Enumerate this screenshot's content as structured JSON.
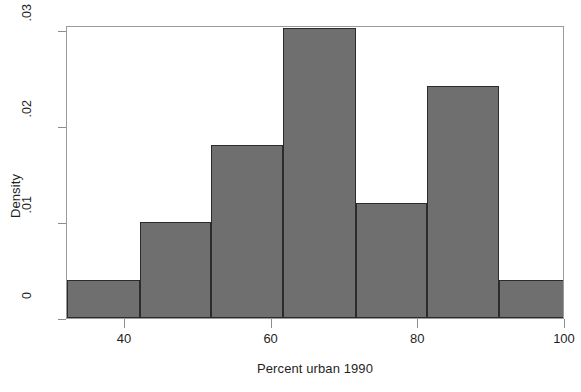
{
  "chart_data": {
    "type": "bar",
    "title": "",
    "subtitle": "",
    "xlabel": "Percent urban 1990",
    "ylabel": "Density",
    "xlim": [
      32.1,
      100.0
    ],
    "ylim": [
      0,
      0.0305
    ],
    "grid": false,
    "legend": null,
    "bin_edges": [
      32.1,
      42.0,
      51.7,
      61.6,
      71.5,
      81.2,
      91.0,
      100.0
    ],
    "categories": [
      "32.1-42.0",
      "42.0-51.7",
      "51.7-61.6",
      "61.6-71.5",
      "71.5-81.2",
      "81.2-91.0",
      "91.0-100.0"
    ],
    "values": [
      0.004,
      0.01,
      0.018,
      0.0302,
      0.012,
      0.0242,
      0.004
    ],
    "x_ticks": [
      40,
      60,
      80,
      100
    ],
    "x_tick_labels": [
      "40",
      "60",
      "80",
      "100"
    ],
    "y_ticks": [
      0,
      0.01,
      0.02,
      0.03
    ],
    "y_tick_labels": [
      "0",
      ".01",
      ".02",
      ".03"
    ],
    "bar_fill_color": "#6f6f6f",
    "bar_edge_color": "#2b2b2b",
    "frame_color": "#9a9a9a",
    "background_color": "#ffffff"
  }
}
